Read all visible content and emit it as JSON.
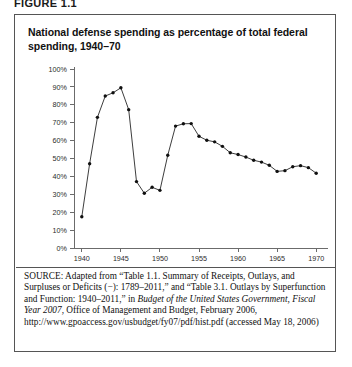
{
  "figure": {
    "label": "FIGURE 1.1",
    "title": "National defense spending as percentage of total federal spending, 1940–70"
  },
  "source": {
    "label": "SOURCE:",
    "text_1": " Adapted from “Table 1.1. Summary of Receipts, Outlays, and Surpluses or Deficits (−): 1789–2011,” and “Table 3.1. Outlays by Superfunction and Function: 1940–2011,” in ",
    "italic_1": "Budget of the United States Government, Fiscal Year 2007",
    "text_2": ", Office of Management and Budget, February 2006, http://www.gpoaccess.gov/usbudget/fy07/pdf/hist.pdf (accessed May 18, 2006)"
  },
  "chart_data": {
    "type": "line",
    "title": "National defense spending as percentage of total federal spending, 1940–70",
    "xlabel": "",
    "ylabel": "",
    "xlim": [
      1939,
      1971
    ],
    "ylim": [
      0,
      100
    ],
    "ytick_labels": [
      "0%",
      "10%",
      "20%",
      "30%",
      "40%",
      "50%",
      "60%",
      "70%",
      "80%",
      "90%",
      "100%"
    ],
    "ytick_values": [
      0,
      10,
      20,
      30,
      40,
      50,
      60,
      70,
      80,
      90,
      100
    ],
    "xtick_labels": [
      "1940",
      "1945",
      "1950",
      "1955",
      "1960",
      "1965",
      "1970"
    ],
    "xtick_values": [
      1940,
      1945,
      1950,
      1955,
      1960,
      1965,
      1970
    ],
    "grid": false,
    "legend": false,
    "marker": "circle",
    "x": [
      1940,
      1941,
      1942,
      1943,
      1944,
      1945,
      1946,
      1947,
      1948,
      1949,
      1950,
      1951,
      1952,
      1953,
      1954,
      1955,
      1956,
      1957,
      1958,
      1959,
      1960,
      1961,
      1962,
      1963,
      1964,
      1965,
      1966,
      1967,
      1968,
      1969,
      1970
    ],
    "values": [
      17.5,
      47.1,
      73.0,
      84.9,
      86.7,
      89.5,
      77.3,
      37.1,
      30.6,
      33.9,
      32.2,
      51.8,
      68.1,
      69.4,
      69.5,
      62.4,
      60.2,
      59.3,
      56.8,
      53.2,
      52.2,
      50.8,
      49.0,
      48.0,
      46.2,
      42.8,
      43.2,
      45.4,
      46.0,
      44.9,
      41.8
    ],
    "series_name": "National defense spending (% of total federal outlays)"
  }
}
